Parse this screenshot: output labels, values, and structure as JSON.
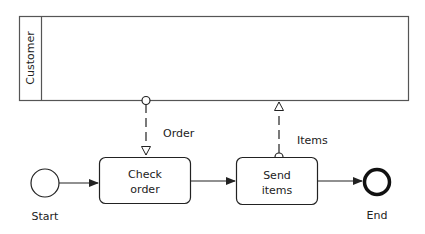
{
  "diagram": {
    "type": "BPMN collaboration",
    "pool": {
      "label": "Customer"
    },
    "events": {
      "start": {
        "label": "Start"
      },
      "end": {
        "label": "End"
      }
    },
    "tasks": [
      {
        "line1": "Check",
        "line2": "order"
      },
      {
        "line1": "Send",
        "line2": "items"
      }
    ],
    "message_flows": [
      {
        "label": "Order",
        "from": "Customer",
        "to": "Check order"
      },
      {
        "label": "Items",
        "from": "Send items",
        "to": "Customer"
      }
    ],
    "sequence_flows": [
      {
        "from": "Start",
        "to": "Check order"
      },
      {
        "from": "Check order",
        "to": "Send items"
      },
      {
        "from": "Send items",
        "to": "End"
      }
    ],
    "colors": {
      "stroke": "#222222",
      "pool_border": "#555555",
      "background": "#ffffff"
    }
  }
}
